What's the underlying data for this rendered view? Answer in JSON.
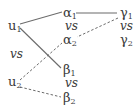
{
  "diagram": {
    "nodes": [
      {
        "id": "u1",
        "base": "u",
        "sub": "1",
        "x": 8,
        "y": 19
      },
      {
        "id": "u2",
        "base": "u",
        "sub": "2",
        "x": 8,
        "y": 75
      },
      {
        "id": "a1",
        "base": "α",
        "sub": "1",
        "x": 63,
        "y": 6
      },
      {
        "id": "a2",
        "base": "α",
        "sub": "2",
        "x": 63,
        "y": 33
      },
      {
        "id": "b1",
        "base": "β",
        "sub": "1",
        "x": 63,
        "y": 63
      },
      {
        "id": "b2",
        "base": "β",
        "sub": "2",
        "x": 63,
        "y": 91
      },
      {
        "id": "g1",
        "base": "γ",
        "sub": "1",
        "x": 120,
        "y": 6
      },
      {
        "id": "g2",
        "base": "γ",
        "sub": "2",
        "x": 120,
        "y": 33
      }
    ],
    "vs_labels": [
      {
        "text": "vs",
        "x": 10,
        "y": 48
      },
      {
        "text": "vs",
        "x": 65,
        "y": 20
      },
      {
        "text": "vs",
        "x": 120,
        "y": 20
      },
      {
        "text": "vs",
        "x": 65,
        "y": 77
      }
    ],
    "edges": [
      {
        "from": "u1",
        "to": "a1",
        "style": "solid",
        "x1": 20,
        "y1": 24,
        "x2": 62,
        "y2": 12
      },
      {
        "from": "u1",
        "to": "b1",
        "style": "solid",
        "x1": 20,
        "y1": 28,
        "x2": 61,
        "y2": 68
      },
      {
        "from": "a1",
        "to": "g1",
        "style": "solid",
        "x1": 76,
        "y1": 13,
        "x2": 117,
        "y2": 13
      },
      {
        "from": "g1",
        "to": "a2",
        "style": "dashed",
        "x1": 118,
        "y1": 18,
        "x2": 77,
        "y2": 37
      },
      {
        "from": "u2",
        "to": "a2",
        "style": "dashed",
        "x1": 20,
        "y1": 80,
        "x2": 62,
        "y2": 43
      },
      {
        "from": "u2",
        "to": "b2",
        "style": "dashed",
        "x1": 20,
        "y1": 87,
        "x2": 61,
        "y2": 97
      }
    ],
    "colors": {
      "line": "#6b6b6b",
      "text": "#3a3a3a"
    }
  }
}
